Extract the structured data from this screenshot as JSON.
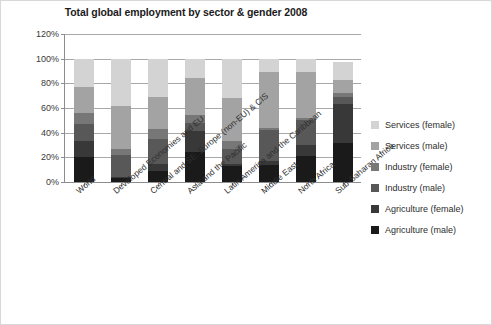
{
  "chart_data": {
    "type": "bar",
    "stacked": true,
    "title": "Total global employment by sector & gender 2008",
    "xlabel": "",
    "ylabel": "",
    "ylim": [
      0,
      120
    ],
    "ytick_labels": [
      "120%",
      "100%",
      "80%",
      "60%",
      "40%",
      "20%",
      "0%"
    ],
    "ytick_values": [
      120,
      100,
      80,
      60,
      40,
      20,
      0
    ],
    "grid": true,
    "legend_position": "right",
    "categories": [
      "World",
      "Developed Economies and EU",
      "Central and SE. Europe (non-EU) & CIS",
      "Asia and the Pacific",
      "Latin America and the Caribbean",
      "Middle East",
      "North Africa",
      "Sub-Saharan Africa"
    ],
    "series": [
      {
        "name": "Agriculture (male)",
        "color": "#1a1a1a",
        "values": [
          20,
          3,
          9,
          24,
          13,
          14,
          21,
          32
        ]
      },
      {
        "name": "Agriculture (female)",
        "color": "#383838",
        "values": [
          13,
          1,
          6,
          17,
          2,
          3,
          9,
          31
        ]
      },
      {
        "name": "Industry (male)",
        "color": "#585858",
        "values": [
          14,
          18,
          20,
          7,
          12,
          25,
          20,
          6
        ]
      },
      {
        "name": "Industry (female)",
        "color": "#777777",
        "values": [
          9,
          5,
          8,
          6,
          6,
          2,
          2,
          3
        ]
      },
      {
        "name": "Services (male)",
        "color": "#a3a3a3",
        "values": [
          21,
          35,
          26,
          30,
          35,
          45,
          37,
          11
        ]
      },
      {
        "name": "Services (female)",
        "color": "#d3d3d3",
        "values": [
          23,
          38,
          31,
          16,
          32,
          11,
          11,
          14
        ]
      }
    ],
    "legend_order": [
      "Services (female)",
      "Services (male)",
      "Industry (female)",
      "Industry (male)",
      "Agriculture (female)",
      "Agriculture (male)"
    ],
    "totals": [
      100,
      100,
      100,
      100,
      100,
      100,
      100,
      97
    ]
  },
  "legend": {
    "items": [
      {
        "label": "Services (female)",
        "color": "#d3d3d3"
      },
      {
        "label": "Services (male)",
        "color": "#a3a3a3"
      },
      {
        "label": "Industry (female)",
        "color": "#777777"
      },
      {
        "label": "Industry (male)",
        "color": "#585858"
      },
      {
        "label": "Agriculture (female)",
        "color": "#383838"
      },
      {
        "label": "Agriculture (male)",
        "color": "#1a1a1a"
      }
    ]
  }
}
